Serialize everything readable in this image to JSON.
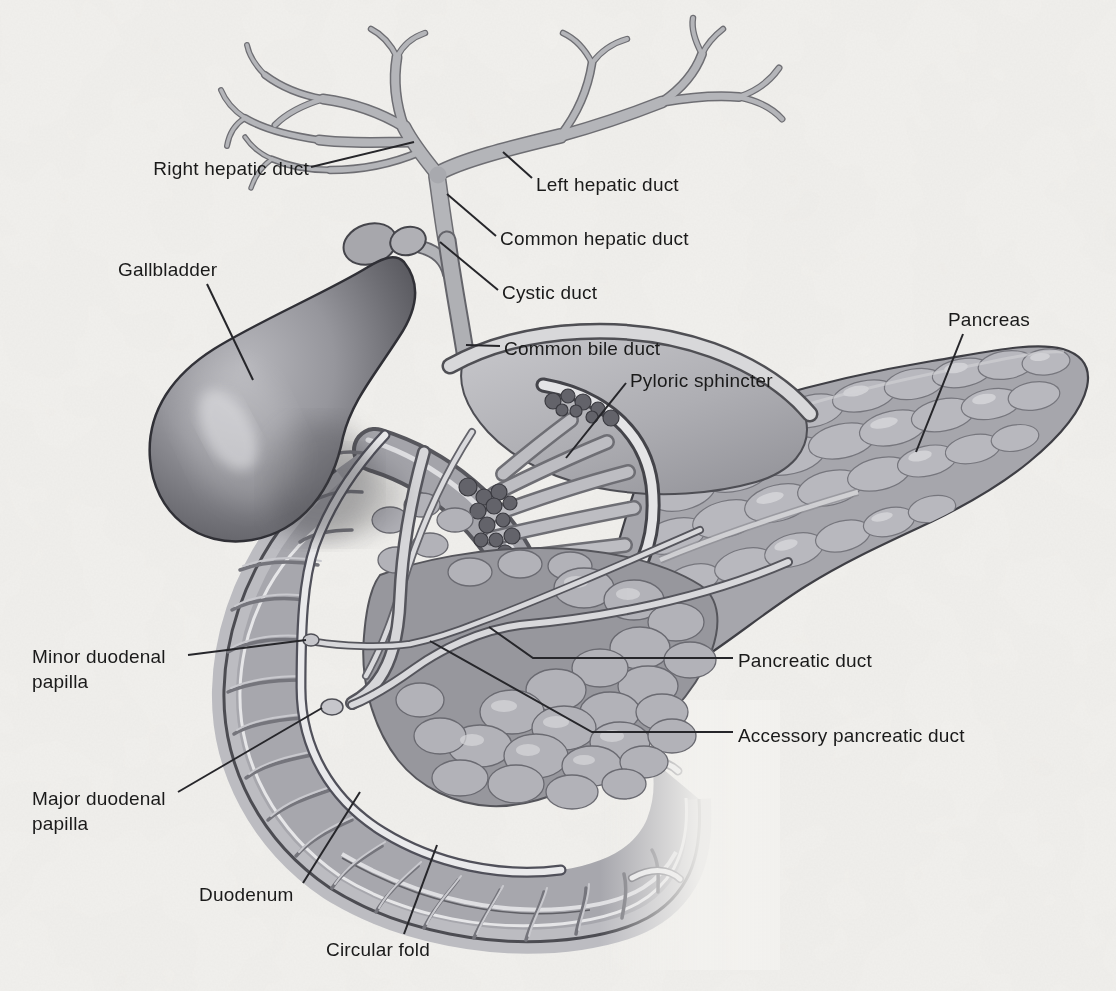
{
  "figure": {
    "kind": "anatomical-illustration",
    "palette": {
      "paper": "#f2f1ee",
      "ink": "#1a1a1a",
      "leader_line": "#26262a",
      "organ_light": "#d8d8db",
      "organ_mid": "#a8a8ad",
      "organ_dark": "#4c4c52"
    },
    "labels": [
      {
        "id": "right-hepatic-duct",
        "text": "Right hepatic duct"
      },
      {
        "id": "left-hepatic-duct",
        "text": "Left hepatic duct"
      },
      {
        "id": "common-hepatic-duct",
        "text": "Common hepatic duct"
      },
      {
        "id": "cystic-duct",
        "text": "Cystic duct"
      },
      {
        "id": "common-bile-duct",
        "text": "Common bile duct"
      },
      {
        "id": "gallbladder",
        "text": "Gallbladder"
      },
      {
        "id": "pancreas",
        "text": "Pancreas"
      },
      {
        "id": "pyloric-sphincter",
        "text": "Pyloric sphincter"
      },
      {
        "id": "minor-duodenal-papilla",
        "text": "Minor duodenal papilla"
      },
      {
        "id": "pancreatic-duct",
        "text": "Pancreatic duct"
      },
      {
        "id": "accessory-pancreatic-duct",
        "text": "Accessory pancreatic duct"
      },
      {
        "id": "major-duodenal-papilla",
        "text": "Major duodenal papilla"
      },
      {
        "id": "duodenum",
        "text": "Duodenum"
      },
      {
        "id": "circular-fold",
        "text": "Circular fold"
      }
    ]
  }
}
